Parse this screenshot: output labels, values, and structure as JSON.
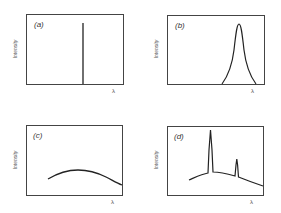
{
  "panels": [
    {
      "id": "a",
      "label": "(a)",
      "ylabel": "Intensity",
      "xlabel": "λ",
      "shape": "single sharp vertical line (monochromatic)"
    },
    {
      "id": "b",
      "label": "(b)",
      "ylabel": "Intensity",
      "xlabel": "λ",
      "shape": "narrow bell-shaped peak"
    },
    {
      "id": "c",
      "label": "(c)",
      "ylabel": "Intensity",
      "xlabel": "λ",
      "shape": "broad continuous hump"
    },
    {
      "id": "d",
      "label": "(d)",
      "ylabel": "Intensity",
      "xlabel": "λ",
      "shape": "broad continuum with two sharp peaks"
    }
  ],
  "colors": {
    "line": "#222222",
    "frame": "#444444",
    "text": "#444444"
  }
}
